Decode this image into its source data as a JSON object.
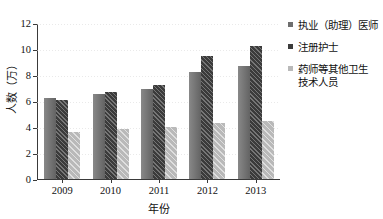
{
  "chart_data": {
    "type": "bar",
    "title": "",
    "xlabel": "年份",
    "ylabel": "人数（万）",
    "categories": [
      "2009",
      "2010",
      "2011",
      "2012",
      "2013"
    ],
    "ylim": [
      0,
      12
    ],
    "yticks": [
      "0",
      "2",
      "4",
      "6",
      "8",
      "10",
      "12"
    ],
    "grid": true,
    "legend_position": "right",
    "series": [
      {
        "name": "执业（助理）医师",
        "color": "#6e6e6e",
        "pattern": "solid",
        "values": [
          6.2,
          6.55,
          6.95,
          8.25,
          8.7
        ]
      },
      {
        "name": "注册护士",
        "color": "#3b3b3b",
        "pattern": "diagonal-hatch",
        "values": [
          6.05,
          6.7,
          7.25,
          9.5,
          10.2
        ]
      },
      {
        "name": "药师等其他卫生\n技术人员",
        "color": "#b9b9b9",
        "pattern": "light-diagonal-hatch",
        "values": [
          3.6,
          3.85,
          4.0,
          4.3,
          4.45
        ]
      }
    ]
  }
}
